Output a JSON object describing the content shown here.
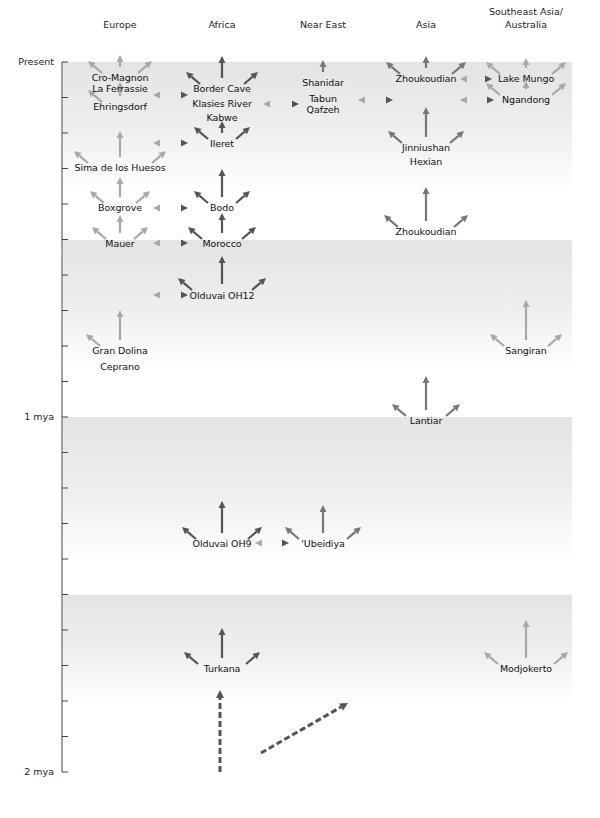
{
  "regions": [
    {
      "name": "Europe",
      "x": 120
    },
    {
      "name": "Africa",
      "x": 222
    },
    {
      "name": "Near East",
      "x": 323
    },
    {
      "name": "Asia",
      "x": 426
    },
    {
      "name": "Southeast Asia/\nAustralia",
      "line1": "Southeast Asia/",
      "line2": "Australia",
      "x": 526
    }
  ],
  "axis": {
    "labels": [
      {
        "text": "Present",
        "y": 62
      },
      {
        "text": "1 mya",
        "y": 417
      },
      {
        "text": "2 mya",
        "y": 772
      }
    ],
    "x": 62,
    "top": 62,
    "bottom": 772,
    "tick_spacing": 35.5,
    "tick_count": 21
  },
  "bands": [
    {
      "top": 62,
      "bottom": 190
    },
    {
      "top": 240,
      "bottom": 370
    },
    {
      "top": 417,
      "bottom": 560
    },
    {
      "top": 595,
      "bottom": 700
    }
  ],
  "band_color": "#e6e6e6",
  "arrow_colors": {
    "dark": "#555555",
    "mid": "#777777",
    "light": "#a8a8a8"
  },
  "sites": [
    {
      "name": "Cro-Magnon",
      "region": "Europe",
      "x": 120,
      "y": 78
    },
    {
      "name": "La Ferrassie",
      "region": "Europe",
      "x": 120,
      "y": 89
    },
    {
      "name": "Ehringsdorf",
      "region": "Europe",
      "x": 120,
      "y": 107
    },
    {
      "name": "Sima de los Huesos",
      "region": "Europe",
      "x": 120,
      "y": 168
    },
    {
      "name": "Boxgrove",
      "region": "Europe",
      "x": 120,
      "y": 208
    },
    {
      "name": "Mauer",
      "region": "Europe",
      "x": 120,
      "y": 244
    },
    {
      "name": "Gran Dolina",
      "region": "Europe",
      "x": 120,
      "y": 351
    },
    {
      "name": "Ceprano",
      "region": "Europe",
      "x": 120,
      "y": 367
    },
    {
      "name": "Border Cave",
      "region": "Africa",
      "x": 222,
      "y": 89
    },
    {
      "name": "Klasies River",
      "region": "Africa",
      "x": 222,
      "y": 104
    },
    {
      "name": "Kabwe",
      "region": "Africa",
      "x": 222,
      "y": 118
    },
    {
      "name": "Ileret",
      "region": "Africa",
      "x": 222,
      "y": 144
    },
    {
      "name": "Bodo",
      "region": "Africa",
      "x": 222,
      "y": 208
    },
    {
      "name": "Morocco",
      "region": "Africa",
      "x": 222,
      "y": 244
    },
    {
      "name": "Olduvai OH12",
      "region": "Africa",
      "x": 222,
      "y": 296
    },
    {
      "name": "Olduvai OH9",
      "region": "Africa",
      "x": 222,
      "y": 544
    },
    {
      "name": "Turkana",
      "region": "Africa",
      "x": 222,
      "y": 669
    },
    {
      "name": "Shanidar",
      "region": "Near East",
      "x": 323,
      "y": 83
    },
    {
      "name": "Tabun",
      "region": "Near East",
      "x": 323,
      "y": 99
    },
    {
      "name": "Qafzeh",
      "region": "Near East",
      "x": 323,
      "y": 110
    },
    {
      "name": "'Ubeidiya",
      "region": "Near East",
      "x": 323,
      "y": 544
    },
    {
      "name": "Zhoukoudian",
      "region": "Asia",
      "x": 426,
      "y": 79
    },
    {
      "name": "Jinniushan",
      "region": "Asia",
      "x": 426,
      "y": 148
    },
    {
      "name": "Hexian",
      "region": "Asia",
      "x": 426,
      "y": 162
    },
    {
      "name": "Zhoukoudian",
      "region": "Asia",
      "x": 426,
      "y": 232
    },
    {
      "name": "Lantiar",
      "region": "Asia",
      "x": 426,
      "y": 421
    },
    {
      "name": "Lake Mungo",
      "region": "Southeast Asia/Australia",
      "x": 526,
      "y": 79
    },
    {
      "name": "Ngandong",
      "region": "Southeast Asia/Australia",
      "x": 526,
      "y": 100
    },
    {
      "name": "Sangiran",
      "region": "Southeast Asia/Australia",
      "x": 526,
      "y": 351
    },
    {
      "name": "Modjokerto",
      "region": "Southeast Asia/Australia",
      "x": 526,
      "y": 669
    }
  ],
  "fans": [
    {
      "x": 120,
      "y": 73,
      "shade": "light",
      "up": 12,
      "spread": 28,
      "left": true,
      "right": true
    },
    {
      "x": 120,
      "y": 102,
      "shade": "light",
      "up": 14,
      "spread": 28,
      "left": true,
      "right": false
    },
    {
      "x": 120,
      "y": 163,
      "shade": "light",
      "up": 26,
      "spread": 42,
      "left": true,
      "right": true
    },
    {
      "x": 120,
      "y": 203,
      "shade": "light",
      "up": 20,
      "spread": 26,
      "left": true,
      "right": true
    },
    {
      "x": 120,
      "y": 239,
      "shade": "light",
      "up": 18,
      "spread": 24,
      "left": true,
      "right": true
    },
    {
      "x": 120,
      "y": 346,
      "shade": "light",
      "up": 30,
      "spread": 30,
      "left": true,
      "right": false
    },
    {
      "x": 222,
      "y": 84,
      "shade": "dark",
      "up": 22,
      "spread": 32,
      "left": true,
      "right": true
    },
    {
      "x": 222,
      "y": 139,
      "shade": "dark",
      "up": 12,
      "spread": 24,
      "left": true,
      "right": true
    },
    {
      "x": 222,
      "y": 203,
      "shade": "dark",
      "up": 28,
      "spread": 24,
      "left": true,
      "right": true
    },
    {
      "x": 222,
      "y": 239,
      "shade": "dark",
      "up": 20,
      "spread": 30,
      "left": true,
      "right": true
    },
    {
      "x": 222,
      "y": 290,
      "shade": "dark",
      "up": 28,
      "spread": 40,
      "left": true,
      "right": true
    },
    {
      "x": 222,
      "y": 539,
      "shade": "dark",
      "up": 32,
      "spread": 36,
      "left": true,
      "right": true
    },
    {
      "x": 222,
      "y": 664,
      "shade": "dark",
      "up": 30,
      "spread": 34,
      "left": true,
      "right": true
    },
    {
      "x": 323,
      "y": 78,
      "shade": "mid",
      "up": 12,
      "spread": 0,
      "left": false,
      "right": false
    },
    {
      "x": 323,
      "y": 539,
      "shade": "mid",
      "up": 28,
      "spread": 34,
      "left": true,
      "right": true
    },
    {
      "x": 426,
      "y": 74,
      "shade": "mid",
      "up": 12,
      "spread": 36,
      "left": true,
      "right": true
    },
    {
      "x": 426,
      "y": 143,
      "shade": "mid",
      "up": 30,
      "spread": 34,
      "left": true,
      "right": true
    },
    {
      "x": 426,
      "y": 227,
      "shade": "mid",
      "up": 34,
      "spread": 38,
      "left": true,
      "right": true
    },
    {
      "x": 426,
      "y": 416,
      "shade": "mid",
      "up": 34,
      "spread": 30,
      "left": true,
      "right": true
    },
    {
      "x": 526,
      "y": 74,
      "shade": "light",
      "up": 10,
      "spread": 36,
      "left": true,
      "right": true
    },
    {
      "x": 526,
      "y": 95,
      "shade": "light",
      "up": 8,
      "spread": 36,
      "left": true,
      "right": true
    },
    {
      "x": 526,
      "y": 346,
      "shade": "light",
      "up": 40,
      "spread": 32,
      "left": true,
      "right": true
    },
    {
      "x": 526,
      "y": 664,
      "shade": "light",
      "up": 38,
      "spread": 38,
      "left": true,
      "right": true
    }
  ],
  "connectors": [
    {
      "x1": 153,
      "x2": 188,
      "y": 95
    },
    {
      "x1": 263,
      "x2": 299,
      "y": 104
    },
    {
      "x1": 358,
      "x2": 393,
      "y": 100
    },
    {
      "x1": 460,
      "x2": 492,
      "y": 79
    },
    {
      "x1": 460,
      "x2": 494,
      "y": 100
    },
    {
      "x1": 153,
      "x2": 188,
      "y": 143
    },
    {
      "x1": 153,
      "x2": 188,
      "y": 208
    },
    {
      "x1": 153,
      "x2": 188,
      "y": 243
    },
    {
      "x1": 153,
      "x2": 188,
      "y": 295
    },
    {
      "x1": 255,
      "x2": 289,
      "y": 543
    }
  ],
  "dashed_arrows": [
    {
      "x1": 220,
      "y1": 772,
      "x2": 220,
      "y2": 690
    },
    {
      "x1": 261,
      "y1": 753,
      "x2": 348,
      "y2": 703
    }
  ]
}
